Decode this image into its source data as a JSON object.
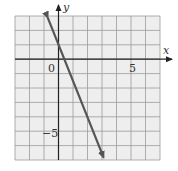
{
  "chart_data": {
    "type": "line",
    "title": "",
    "xlabel": "x",
    "ylabel": "y",
    "xlim": [
      -3,
      7
    ],
    "ylim": [
      -7,
      3
    ],
    "grid": true,
    "grid_step": 1,
    "tick_labels": {
      "origin": "0",
      "x": [
        {
          "value": 5,
          "label": "5"
        }
      ],
      "y": [
        {
          "value": -5,
          "label": "−5"
        }
      ]
    },
    "series": [
      {
        "name": "line",
        "equation_estimate": "y = -2.5x + 1",
        "points": [
          {
            "x": -0.75,
            "y": 2.9
          },
          {
            "x": 0,
            "y": 1
          },
          {
            "x": 0.4,
            "y": 0
          },
          {
            "x": 3.1,
            "y": -6.8
          }
        ],
        "arrows_both_ends": true,
        "color": "#555555"
      }
    ]
  },
  "labels": {
    "x_axis": "x",
    "y_axis": "y",
    "origin": "0",
    "x_tick_5": "5",
    "y_tick_neg5": "−5"
  },
  "colors": {
    "grid_bg": "#eeeeee",
    "grid_line": "#9a9a9a",
    "axis": "#222222",
    "line": "#555555"
  }
}
